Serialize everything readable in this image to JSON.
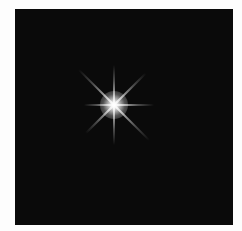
{
  "image": {
    "subject": "four-pointed starburst sparkle on black square",
    "background_color": "#0a0a0a",
    "border_color": "#fdfdfd",
    "star_color": "#ffffff",
    "rays": [
      {
        "angle": 0,
        "length": 40
      },
      {
        "angle": 90,
        "length": 40
      },
      {
        "angle": 180,
        "length": 30
      },
      {
        "angle": 270,
        "length": 40
      },
      {
        "angle": 45,
        "length": 50
      },
      {
        "angle": 135,
        "length": 40
      },
      {
        "angle": 225,
        "length": 50
      },
      {
        "angle": 315,
        "length": 45
      }
    ]
  }
}
